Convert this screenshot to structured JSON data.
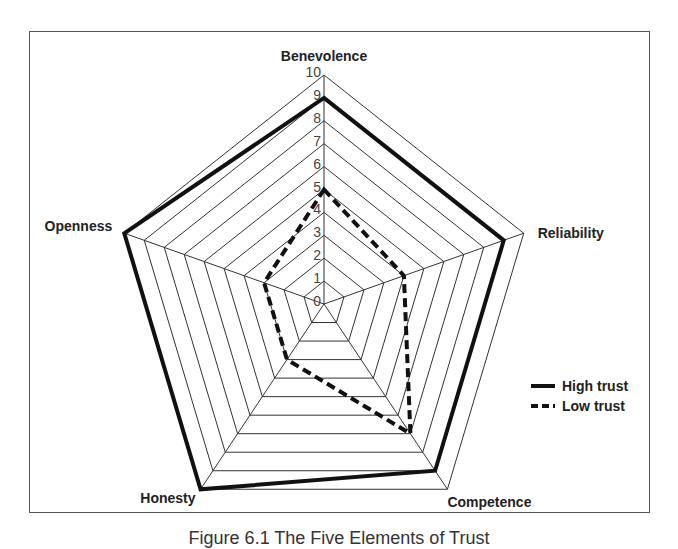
{
  "chart_data": {
    "type": "radar",
    "title": "",
    "caption": "Figure 6.1 The Five Elements of Trust",
    "axes": [
      "Benevolence",
      "Reliability",
      "Competence",
      "Honesty",
      "Openness"
    ],
    "scale": {
      "min": 0,
      "max": 10,
      "step": 1,
      "ticks": [
        "0",
        "1",
        "2",
        "3",
        "4",
        "5",
        "6",
        "7",
        "8",
        "9",
        "10"
      ]
    },
    "grid": true,
    "legend_position": "right",
    "series": [
      {
        "name": "High trust",
        "style": "solid",
        "values": [
          9,
          9,
          9,
          10,
          10
        ]
      },
      {
        "name": "Low trust",
        "style": "dashed",
        "values": [
          5,
          4,
          7,
          3,
          3
        ]
      }
    ]
  },
  "legend": {
    "items": [
      {
        "label": "High trust",
        "style": "solid"
      },
      {
        "label": "Low trust",
        "style": "dashed"
      }
    ]
  },
  "caption": "Figure 6.1 The Five Elements of Trust",
  "colors": {
    "line": "#111111",
    "grid": "#333333",
    "frame": "#555555"
  }
}
